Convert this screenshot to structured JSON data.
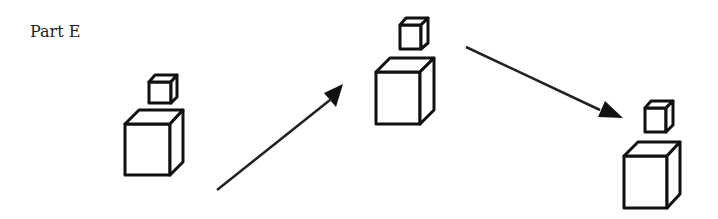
{
  "figure": {
    "label": "Part E",
    "groups": [
      {
        "name": "left",
        "small_cube": "stacked-above",
        "big_cube": "base"
      },
      {
        "name": "middle",
        "small_cube": "stacked-above",
        "big_cube": "base"
      },
      {
        "name": "right",
        "small_cube": "stacked-above",
        "big_cube": "base"
      }
    ],
    "arrows": [
      {
        "from": "left",
        "to": "middle",
        "direction": "up-right"
      },
      {
        "from": "middle",
        "to": "right",
        "direction": "down-right"
      }
    ],
    "colors": {
      "stroke": "#111111",
      "background": "#ffffff"
    }
  }
}
